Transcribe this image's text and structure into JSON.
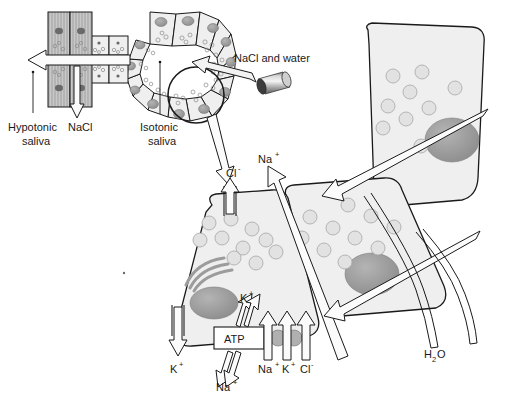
{
  "figure": {
    "domain": "biology-diagram",
    "background_color": "#ffffff",
    "line_color": "#1a1a1a",
    "cell_fill": "#efefef",
    "duct_cell_fill": "#c8c8c8",
    "nucleus_fill": "#9a9a9a",
    "granule_fill": "#dcdcdc",
    "arrow_fill": "#f2f2f2",
    "transporter_fill": "#b0b0b0"
  },
  "labels": {
    "hypotonic_saliva": "Hypotonic\nsaliva",
    "hypotonic_saliva_line1": "Hypotonic",
    "hypotonic_saliva_line2": "saliva",
    "nacl_duct": "NaCl",
    "isotonic_saliva_line1": "Isotonic",
    "isotonic_saliva_line2": "saliva",
    "nacl_and_water": "NaCl and water",
    "chloride_apical": "Cl",
    "chloride_apical_charge": "-",
    "sodium_paracellular": "Na",
    "sodium_paracellular_charge": "+",
    "potassium_basolateral": "K",
    "potassium_basolateral_charge": "+",
    "potassium_pump_in": "K",
    "potassium_pump_in_charge": "+",
    "sodium_pump_out": "Na",
    "sodium_pump_out_charge": "+",
    "atp": "ATP",
    "cotransport_na": "Na",
    "cotransport_na_charge": "+",
    "cotransport_k": "K",
    "cotransport_k_charge": "+",
    "cotransport_cl": "Cl",
    "cotransport_cl_charge": "-",
    "water": "H",
    "water_subscript": "2",
    "water_tail": "O"
  },
  "structures": {
    "acinus": "ring of wedge-shaped acinar cells with secretory granules",
    "intercalated_duct": "small cuboidal duct cells connecting acinus to striated duct",
    "striated_duct": "two rows of tall striated duct cells with basal striations",
    "blood_vessel": "3D cylinder representing capillary supplying NaCl and water",
    "magnifier_circle": "circle highlighting one acinar cell, enlarged below",
    "enlarged_acinar_cell": "detailed acinar cell showing Golgi, nucleus, granules, transporters",
    "neighbor_cells": "two adjacent acinar cells shown behind to the right",
    "golgi": "stack of curved cisternae",
    "water_pathway": "paired curved lines tracing osmotic water flow"
  },
  "transport_events": [
    {
      "id": "cl-apical",
      "ion": "Cl-",
      "direction": "out (apical, into lumen)",
      "mechanism": "chloride channel"
    },
    {
      "id": "na-paracellular",
      "ion": "Na+",
      "direction": "out (paracellular, into lumen)",
      "mechanism": "tight-junction leak"
    },
    {
      "id": "k-basolateral",
      "ion": "K+",
      "direction": "out (basolateral, to interstitium)",
      "mechanism": "potassium channel"
    },
    {
      "id": "na-k-atpase",
      "ion": "Na+/K+",
      "direction": "Na+ out, K+ in",
      "mechanism": "Na+/K+-ATPase (ATP)"
    },
    {
      "id": "nkcc",
      "ion": "Na+ K+ Cl-",
      "direction": "in (basolateral)",
      "mechanism": "Na-K-2Cl cotransporter"
    },
    {
      "id": "water-osmosis",
      "ion": "H2O",
      "direction": "follows solute into lumen",
      "mechanism": "osmosis"
    },
    {
      "id": "duct-nacl",
      "ion": "NaCl",
      "direction": "reabsorbed from duct lumen",
      "mechanism": "duct cell reabsorption"
    }
  ]
}
